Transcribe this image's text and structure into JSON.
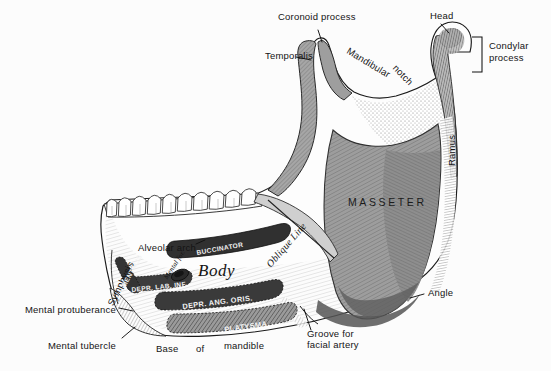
{
  "figure": {
    "background_color": "#fcfcfc",
    "ink_color": "#141414",
    "bone_fill": "#fdfdfd",
    "muscle_gray_light": "#b4b4b4",
    "muscle_gray_mid": "#9a9a9a",
    "muscle_gray_dark": "#7d7d7d",
    "muscle_gray_darker": "#6a6a6a"
  },
  "labels": {
    "coronoid_process": "Coronoid process",
    "temporalis": "Temporalis",
    "mandibular_notch": "Mandibular  notch",
    "mandibular_notch_part1": "Mandibular",
    "mandibular_notch_part2": "notch",
    "head": "Head",
    "condylar_process_line1": "Condylar",
    "condylar_process_line2": "process",
    "ramus": "Ramus",
    "masseter": "MASSETER",
    "angle": "Angle",
    "groove_line1": "Groove for",
    "groove_line2": "facial artery",
    "alveolar_arch": "Alveolar arch",
    "buccinator": "BUCCINATOR",
    "oblique_line": "Oblique Line",
    "body": "Body",
    "mental_foramen": "Mental for.",
    "symphysis": "Symphysis",
    "mentalis": "MENTALIS",
    "depressor_labii_inferioris": "DEPR. LAB. INF.",
    "depressor_anguli_oris": "DEPR. ANG. ORIS.",
    "platysma": "PLATYSMA",
    "mental_protuberance": "Mental protuberance",
    "mental_tubercle": "Mental tubercle",
    "base_word": "Base",
    "of_word": "of",
    "mandible_word": "mandible"
  }
}
